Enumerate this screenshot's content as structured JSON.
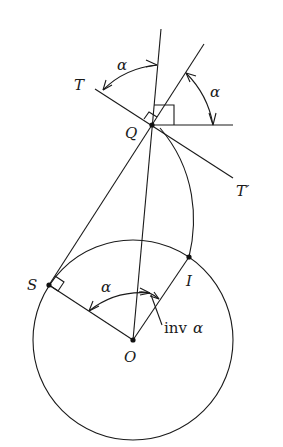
{
  "diagram": {
    "points": {
      "T": "T",
      "T_prime": "T′",
      "Q": "Q",
      "S": "S",
      "I": "I",
      "O": "O"
    },
    "angles": {
      "alpha_top": "α",
      "alpha_right": "α",
      "alpha_center": "α",
      "inv_prefix": "inv",
      "inv_alpha": "α"
    },
    "colors": {
      "stroke": "#1a1a1a",
      "background": "#ffffff"
    }
  }
}
